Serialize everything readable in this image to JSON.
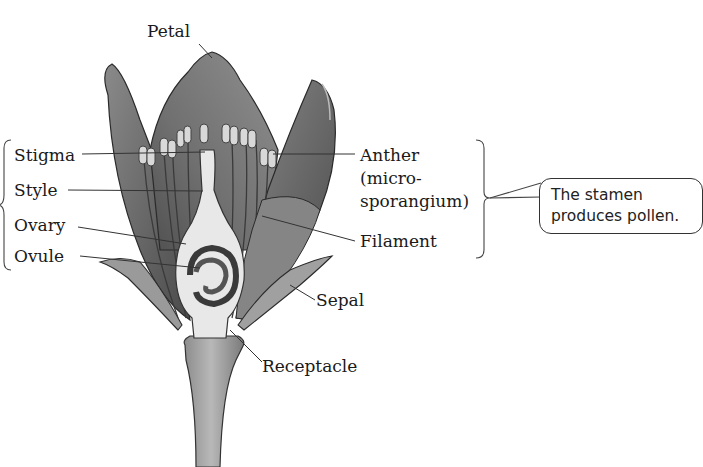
{
  "diagram": {
    "labels": {
      "petal": "Petal",
      "stigma": "Stigma",
      "style": "Style",
      "ovary": "Ovary",
      "ovule": "Ovule",
      "anther": "Anther",
      "anther_sub1": "(micro-",
      "anther_sub2": "sporangium)",
      "filament": "Filament",
      "sepal": "Sepal",
      "receptacle": "Receptacle"
    },
    "callout": {
      "line1": "The stamen",
      "line2": "produces pollen."
    },
    "groups": {
      "left_upper_bracket": [
        "Stigma",
        "Style"
      ],
      "left_lower_bracket": [
        "Ovary",
        "Ovule"
      ],
      "right_bracket": [
        "Anther (microsporangium)",
        "Filament"
      ]
    },
    "colors": {
      "petal_dark": "#5a5a5a",
      "petal_mid": "#7a7a7a",
      "pistil_fill": "#e6e6e6",
      "stem_fill": "#a9a9a9",
      "leader_line": "#333333",
      "text": "#1a1a1a"
    }
  }
}
